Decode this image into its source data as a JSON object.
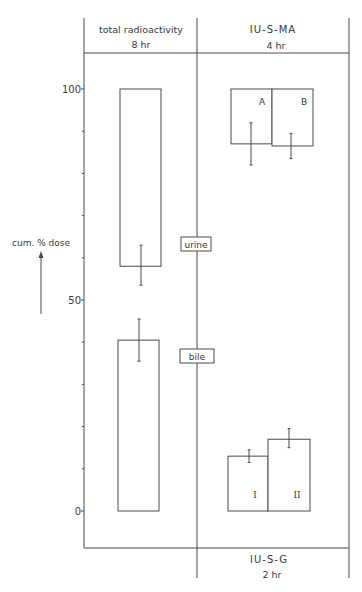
{
  "chart_data": {
    "type": "bar",
    "title": "",
    "ylabel": "cum. % dose",
    "ylim": [
      0,
      100
    ],
    "yticks": [
      0,
      10,
      20,
      30,
      40,
      50,
      60,
      70,
      80,
      90,
      100
    ],
    "ytick_labels": [
      "0",
      "50",
      "100"
    ],
    "grid": false,
    "panels": [
      {
        "header": "total radioactivity",
        "subheader": "8 hr",
        "bars": [
          {
            "label": "urine",
            "bottom": 58,
            "top": 100,
            "value": 42,
            "error_center": 58,
            "error_low": 53.5,
            "error_high": 63
          },
          {
            "label": "bile",
            "bottom": 0,
            "top": 40.5,
            "value": 40.5,
            "error_center": 40.5,
            "error_low": 35.5,
            "error_high": 45.5
          }
        ]
      },
      {
        "header": "IU-S-MA",
        "subheader": "4 hr",
        "bars": [
          {
            "label": "A",
            "bottom": 87,
            "top": 100,
            "value": 13,
            "error_center": 87,
            "error_low": 82,
            "error_high": 92
          },
          {
            "label": "B",
            "bottom": 86.5,
            "top": 100,
            "value": 13.5,
            "error_center": 86,
            "error_low": 83.5,
            "error_high": 89.5
          }
        ]
      },
      {
        "header": "IU-S-G",
        "subheader": "2 hr",
        "bars": [
          {
            "label": "I",
            "bottom": 0,
            "top": 13,
            "value": 13,
            "error_center": 13,
            "error_low": 11.5,
            "error_high": 14.5
          },
          {
            "label": "II",
            "bottom": 0,
            "top": 17,
            "value": 17,
            "error_center": 17,
            "error_low": 15,
            "error_high": 19.5
          }
        ]
      }
    ],
    "region_labels": [
      "urine",
      "bile"
    ]
  },
  "figure": {
    "ylabel": "cum. % dose",
    "tick_0": "0",
    "tick_50": "50",
    "tick_100": "100",
    "top_left_title": "total radioactivity",
    "top_left_sub": "8 hr",
    "top_right_title": "IU-S-MA",
    "top_right_sub": "4 hr",
    "bottom_right_title": "IU-S-G",
    "bottom_right_sub": "2 hr",
    "urine_label": "urine",
    "bile_label": "bile",
    "bar_a_label": "A",
    "bar_b_label": "B",
    "bar_i_label": "I",
    "bar_ii_label": "II"
  }
}
